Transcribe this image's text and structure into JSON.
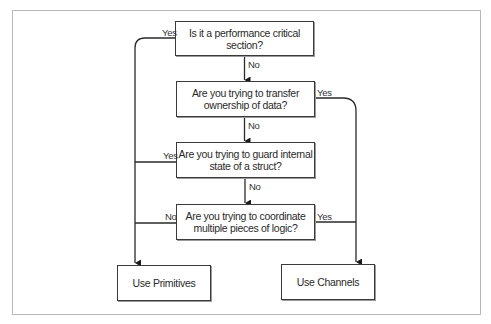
{
  "diagram": {
    "type": "flowchart",
    "colors": {
      "line": "#2a2a2a",
      "box_border": "#3a3a3a",
      "frame": "#b8b8b8",
      "text": "#2a2a2a"
    },
    "nodes": {
      "q1": {
        "line1": "Is it a performance critical section?",
        "line2": ""
      },
      "q2": {
        "line1": "Are you trying to transfer",
        "line2": "ownership of data?"
      },
      "q3": {
        "line1": "Are you trying to guard internal",
        "line2": "state of a struct?"
      },
      "q4": {
        "line1": "Are you trying to coordinate",
        "line2": "multiple pieces of logic?"
      },
      "primitives": {
        "label": "Use Primitives"
      },
      "channels": {
        "label": "Use Channels"
      }
    },
    "edges": {
      "q1_yes": "Yes",
      "q1_no": "No",
      "q2_yes": "Yes",
      "q2_no": "No",
      "q3_yes": "Yes",
      "q3_no": "No",
      "q4_no": "No",
      "q4_yes": "Yes"
    }
  }
}
